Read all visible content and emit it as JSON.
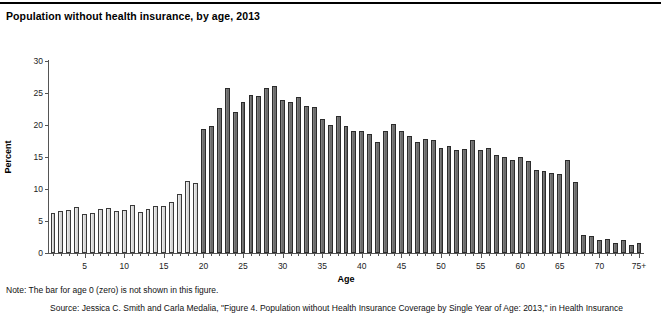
{
  "figure": {
    "title": "Population without health insurance, by age, 2013",
    "note": "Note: The bar for age 0 (zero) is not shown in this figure.",
    "source": "Source: Jessica C. Smith and Carla Medalia, \"Figure 4. Population without Health Insurance Coverage by Single Year of Age: 2013,\" in Health Insurance"
  },
  "chart_data": {
    "type": "bar",
    "title": "Population without health insurance, by age, 2013",
    "xlabel": "Age",
    "ylabel": "Percent",
    "ylim": [
      0,
      30
    ],
    "ytick_labels": [
      "0",
      "5",
      "10",
      "15",
      "20",
      "25",
      "30"
    ],
    "ytick_values": [
      0,
      5,
      10,
      15,
      20,
      25,
      30
    ],
    "xtick_labels": [
      "5",
      "10",
      "15",
      "20",
      "25",
      "30",
      "35",
      "40",
      "45",
      "50",
      "55",
      "60",
      "65",
      "70",
      "75+"
    ],
    "xtick_values": [
      5,
      10,
      15,
      20,
      25,
      30,
      35,
      40,
      45,
      50,
      55,
      60,
      65,
      70,
      75
    ],
    "grid": false,
    "legend": false,
    "categories": [
      1,
      2,
      3,
      4,
      5,
      6,
      7,
      8,
      9,
      10,
      11,
      12,
      13,
      14,
      15,
      16,
      17,
      18,
      19,
      20,
      21,
      22,
      23,
      24,
      25,
      26,
      27,
      28,
      29,
      30,
      31,
      32,
      33,
      34,
      35,
      36,
      37,
      38,
      39,
      40,
      41,
      42,
      43,
      44,
      45,
      46,
      47,
      48,
      49,
      50,
      51,
      52,
      53,
      54,
      55,
      56,
      57,
      58,
      59,
      60,
      61,
      62,
      63,
      64,
      65,
      66,
      67,
      68,
      69,
      70,
      71,
      72,
      73,
      74,
      75
    ],
    "values": [
      6.2,
      6.6,
      6.7,
      7.2,
      6.1,
      6.3,
      6.9,
      7.1,
      6.5,
      6.7,
      7.5,
      6.4,
      6.8,
      7.3,
      7.4,
      8.0,
      9.2,
      11.2,
      11.0,
      19.3,
      19.9,
      22.6,
      25.8,
      22.1,
      23.6,
      24.7,
      24.6,
      25.8,
      26.1,
      23.9,
      23.6,
      24.3,
      23.0,
      22.8,
      20.9,
      20.0,
      21.4,
      19.9,
      19.0,
      19.0,
      18.6,
      17.4,
      19.1,
      20.2,
      19.0,
      18.3,
      17.3,
      17.8,
      17.6,
      16.4,
      16.7,
      16.1,
      16.2,
      17.6,
      16.1,
      16.4,
      15.3,
      15.0,
      14.6,
      15.0,
      14.4,
      13.0,
      12.8,
      12.5,
      12.3,
      14.5,
      11.1,
      2.8,
      2.6,
      2.0,
      2.2,
      1.6,
      2.0,
      1.3,
      1.5
    ],
    "series_colors": {
      "light_bars": "#dcdcdc",
      "dark_bars": "#6f6f6f"
    },
    "light_bar_max_age": 19,
    "annotation": "Bars for ages 1-19 are light shaded; ages 20-75+ are dark shaded."
  }
}
